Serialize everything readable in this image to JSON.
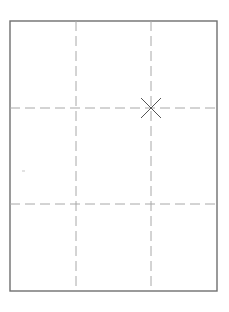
{
  "frame": {
    "x": 10,
    "y": 21,
    "width": 207,
    "height": 270,
    "stroke": "#6f6f6f",
    "stroke_width": 1.4
  },
  "grid": {
    "stroke": "#a8a8a8",
    "dash": "10 5",
    "vertical_lines_x": [
      76,
      151
    ],
    "horizontal_lines_y": [
      108,
      204
    ]
  },
  "marker": {
    "type": "x-cross",
    "cx": 151,
    "cy": 108,
    "size": 10,
    "stroke": "#555555"
  },
  "speck": {
    "x": 22,
    "y": 170,
    "color": "#e2e2e2"
  }
}
